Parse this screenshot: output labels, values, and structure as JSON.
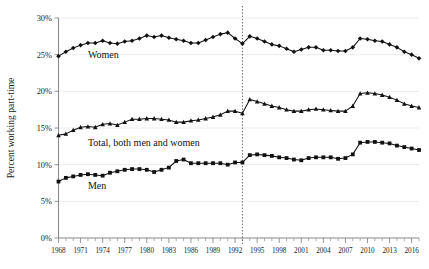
{
  "chart_data": {
    "type": "line",
    "title": "",
    "xlabel": "",
    "ylabel": "Percent working part-time",
    "xlim": [
      1968,
      2017
    ],
    "ylim": [
      0,
      30
    ],
    "grid": true,
    "legend_position": "inline-annotations",
    "y_tick_labels": [
      "0%",
      "5%",
      "10%",
      "15%",
      "20%",
      "25%",
      "30%"
    ],
    "y_tick_values": [
      0,
      5,
      10,
      15,
      20,
      25,
      30
    ],
    "x_tick_labels": [
      "1968",
      "1971",
      "1974",
      "1977",
      "1980",
      "1983",
      "1986",
      "1989",
      "1992",
      "1995",
      "1998",
      "2001",
      "2004",
      "2007",
      "2010",
      "2013",
      "2016"
    ],
    "x_tick_values": [
      1968,
      1971,
      1974,
      1977,
      1980,
      1983,
      1986,
      1989,
      1992,
      1995,
      1998,
      2001,
      2004,
      2007,
      2010,
      2013,
      2016
    ],
    "annotations": [
      {
        "text": "Women",
        "x": 1972,
        "y": 25.0
      },
      {
        "text": "Total, both men and women",
        "x": 1972,
        "y": 13.0
      },
      {
        "text": "Men",
        "x": 1972,
        "y": 7.2
      }
    ],
    "vertical_reference_line": {
      "x": 1993,
      "style": "dotted"
    },
    "x": [
      1968,
      1969,
      1970,
      1971,
      1972,
      1973,
      1974,
      1975,
      1976,
      1977,
      1978,
      1979,
      1980,
      1981,
      1982,
      1983,
      1984,
      1985,
      1986,
      1987,
      1988,
      1989,
      1990,
      1991,
      1992,
      1993,
      1994,
      1995,
      1996,
      1997,
      1998,
      1999,
      2000,
      2001,
      2002,
      2003,
      2004,
      2005,
      2006,
      2007,
      2008,
      2009,
      2010,
      2011,
      2012,
      2013,
      2014,
      2015,
      2016,
      2017
    ],
    "series": [
      {
        "name": "Women",
        "marker": "diamond",
        "values": [
          24.8,
          25.4,
          25.9,
          26.3,
          26.6,
          26.6,
          26.9,
          26.6,
          26.5,
          26.8,
          26.9,
          27.2,
          27.6,
          27.4,
          27.6,
          27.3,
          27.1,
          26.9,
          26.6,
          26.6,
          27.0,
          27.4,
          27.8,
          28.0,
          27.2,
          26.5,
          27.5,
          27.2,
          26.8,
          26.4,
          26.2,
          25.8,
          25.4,
          25.7,
          26.0,
          26.0,
          25.6,
          25.6,
          25.5,
          25.5,
          26.0,
          27.2,
          27.1,
          26.9,
          26.8,
          26.4,
          26.0,
          25.4,
          25.0,
          24.5
        ],
        "color": "#111111"
      },
      {
        "name": "Total, both men and women",
        "marker": "triangle",
        "values": [
          14.0,
          14.2,
          14.7,
          15.1,
          15.2,
          15.1,
          15.5,
          15.6,
          15.4,
          15.8,
          16.2,
          16.2,
          16.3,
          16.3,
          16.2,
          16.1,
          15.8,
          15.8,
          16.0,
          16.1,
          16.3,
          16.5,
          16.8,
          17.3,
          17.3,
          17.0,
          18.9,
          18.6,
          18.3,
          18.0,
          17.8,
          17.5,
          17.3,
          17.3,
          17.5,
          17.6,
          17.5,
          17.4,
          17.3,
          17.3,
          18.0,
          19.7,
          19.8,
          19.7,
          19.5,
          19.2,
          18.8,
          18.3,
          18.0,
          17.8
        ],
        "color": "#111111"
      },
      {
        "name": "Men",
        "marker": "square",
        "values": [
          7.7,
          8.2,
          8.4,
          8.6,
          8.7,
          8.6,
          8.5,
          8.9,
          9.1,
          9.3,
          9.4,
          9.4,
          9.3,
          9.0,
          9.3,
          9.6,
          10.5,
          10.7,
          10.2,
          10.2,
          10.2,
          10.2,
          10.2,
          10.0,
          10.3,
          10.3,
          11.3,
          11.4,
          11.3,
          11.2,
          11.0,
          10.9,
          10.7,
          10.6,
          10.9,
          11.0,
          11.0,
          11.0,
          10.8,
          10.9,
          11.4,
          13.0,
          13.1,
          13.1,
          13.0,
          12.9,
          12.6,
          12.4,
          12.2,
          12.0
        ],
        "color": "#111111"
      }
    ]
  }
}
